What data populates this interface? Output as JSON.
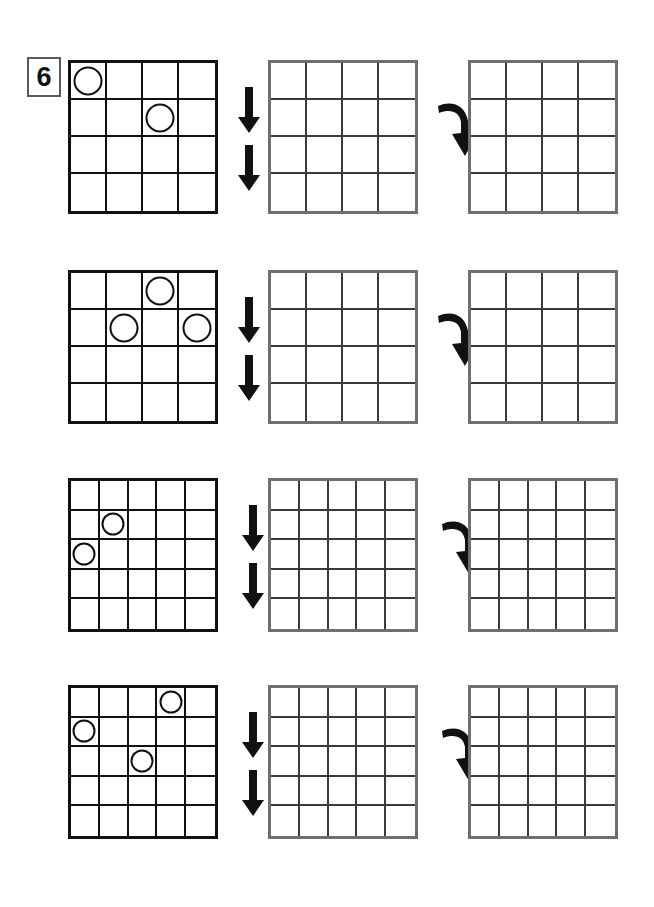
{
  "worksheet": {
    "exercise_number": "6",
    "background_color": "#ffffff",
    "ink_color": "#111111",
    "blank_grid_color": "#6f6f6f",
    "rows": [
      {
        "id": "row-1",
        "grid_rows": 4,
        "grid_cols": 4,
        "source_circles": [
          {
            "row": 0,
            "col": 0
          },
          {
            "row": 1,
            "col": 2
          }
        ],
        "arrow_down_label": "double-down-arrow",
        "arrow_curved_label": "curved-down-arrow",
        "middle_grid_circles": [],
        "right_grid_circles": []
      },
      {
        "id": "row-2",
        "grid_rows": 4,
        "grid_cols": 4,
        "source_circles": [
          {
            "row": 0,
            "col": 2
          },
          {
            "row": 1,
            "col": 1
          },
          {
            "row": 1,
            "col": 3
          }
        ],
        "arrow_down_label": "double-down-arrow",
        "arrow_curved_label": "curved-down-arrow",
        "middle_grid_circles": [],
        "right_grid_circles": []
      },
      {
        "id": "row-3",
        "grid_rows": 5,
        "grid_cols": 5,
        "source_circles": [
          {
            "row": 1,
            "col": 1
          },
          {
            "row": 2,
            "col": 0
          }
        ],
        "arrow_down_label": "double-down-arrow",
        "arrow_curved_label": "curved-down-arrow",
        "middle_grid_circles": [],
        "right_grid_circles": []
      },
      {
        "id": "row-4",
        "grid_rows": 5,
        "grid_cols": 5,
        "source_circles": [
          {
            "row": 0,
            "col": 3
          },
          {
            "row": 1,
            "col": 0
          },
          {
            "row": 2,
            "col": 2
          }
        ],
        "arrow_down_label": "double-down-arrow",
        "arrow_curved_label": "curved-down-arrow",
        "middle_grid_circles": [],
        "right_grid_circles": []
      }
    ],
    "geometry": {
      "row_tops": [
        60,
        270,
        478,
        685
      ],
      "grid_lefts": [
        68,
        268,
        468
      ],
      "grid_size": [
        150,
        154
      ],
      "arrow_down_lefts": [
        232,
        232,
        236,
        236
      ],
      "arrow_curved_lefts": [
        438,
        438,
        442,
        442
      ]
    }
  }
}
